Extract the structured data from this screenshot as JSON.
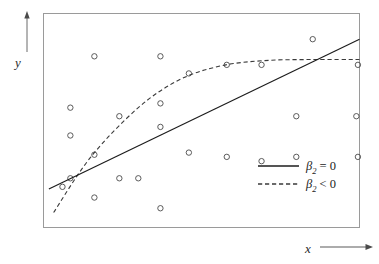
{
  "chart_data": {
    "type": "scatter",
    "title": "",
    "xlabel": "x",
    "ylabel": "y",
    "grid": false,
    "axis_style": "arrow-axes, boxed plot frame, no tick marks, no tick labels",
    "xlim": [
      0,
      1
    ],
    "ylim": [
      0,
      1
    ],
    "scatter": {
      "name": "observations",
      "marker": "open-circle",
      "count": 26,
      "x": [
        0.161,
        0.37,
        0.085,
        0.46,
        0.085,
        0.37,
        0.852,
        0.69,
        0.58,
        0.995,
        0.99,
        0.8,
        0.24,
        0.37,
        0.8,
        0.995,
        0.58,
        0.46,
        0.161,
        0.69,
        0.085,
        0.24,
        0.3,
        0.161,
        0.06,
        0.37
      ],
      "y": [
        0.8,
        0.8,
        0.56,
        0.72,
        0.43,
        0.58,
        0.88,
        0.76,
        0.76,
        0.76,
        0.52,
        0.52,
        0.52,
        0.47,
        0.33,
        0.33,
        0.33,
        0.35,
        0.34,
        0.31,
        0.23,
        0.23,
        0.23,
        0.14,
        0.19,
        0.09
      ]
    },
    "series": [
      {
        "name": "beta2 = 0",
        "label_html": "β₂ = 0",
        "style": "solid",
        "type": "line",
        "color": "#1c1c1c",
        "description": "straight upward-sloping regression line",
        "x": [
          0.017,
          1.0
        ],
        "y": [
          0.18,
          0.88
        ]
      },
      {
        "name": "beta2 < 0",
        "label_html": "β₂ < 0",
        "style": "dashed",
        "type": "curve",
        "color": "#3a3a3a",
        "description": "concave curve rising steeply then flattening to a plateau",
        "x": [
          0.032,
          0.15,
          0.3,
          0.43,
          0.56,
          0.7,
          0.85,
          1.0
        ],
        "y": [
          0.07,
          0.33,
          0.56,
          0.69,
          0.755,
          0.78,
          0.785,
          0.785
        ]
      }
    ],
    "legend": {
      "position": "lower-right inside plot frame",
      "entries": [
        {
          "label_plain": "β₂ = 0",
          "beta": "β",
          "subscript": "2",
          "relation": "= 0",
          "style": "solid"
        },
        {
          "label_plain": "β₂ < 0",
          "beta": "β",
          "subscript": "2",
          "relation": "< 0",
          "style": "dashed"
        }
      ]
    },
    "annotations": [
      {
        "text": "y",
        "role": "y-axis-label-with-up-arrow"
      },
      {
        "text": "x",
        "role": "x-axis-label-with-right-arrow"
      }
    ],
    "colors": {
      "background": "#ffffff",
      "frame": "#9a9a9a",
      "solid_line": "#1c1c1c",
      "dashed_line": "#3a3a3a",
      "marker_stroke": "#4a4a4a",
      "axis_arrow": "#4a4a4a",
      "text": "#1c1c1c"
    }
  }
}
